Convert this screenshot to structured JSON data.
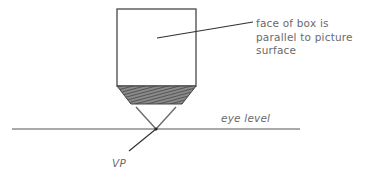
{
  "diagram": {
    "type": "one-point perspective illustration",
    "labels": {
      "annotation_line1": "face of box is",
      "annotation_line2": "parallel to picture",
      "annotation_line3": "surface",
      "eye_level": "eye level",
      "vanishing_point": "VP"
    },
    "colors": {
      "line": "#555555",
      "text": "#6a6a6a",
      "shading": "#5a5a5a",
      "background": "#ffffff"
    },
    "shapes": {
      "box_front_face": {
        "x": 117,
        "y": 9,
        "width": 79,
        "height": 77
      },
      "box_bottom_shaded": {
        "points": "117,86 196,86 182,104 131,104"
      },
      "eye_level_line": {
        "x1": 12,
        "y1": 129,
        "x2": 300,
        "y2": 129
      },
      "vanishing_point": {
        "x": 156,
        "y": 129
      }
    }
  }
}
